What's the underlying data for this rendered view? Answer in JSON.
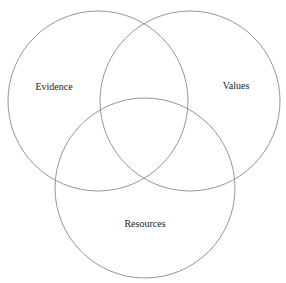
{
  "diagram": {
    "type": "venn",
    "stroke_color": "#8a8a8a",
    "circles": [
      {
        "id": "evidence",
        "label": "Evidence",
        "cx": 98,
        "cy": 101,
        "r": 90,
        "label_x": 54,
        "label_y": 86
      },
      {
        "id": "values",
        "label": "Values",
        "cx": 190,
        "cy": 101,
        "r": 90,
        "label_x": 236,
        "label_y": 85
      },
      {
        "id": "resources",
        "label": "Resources",
        "cx": 145,
        "cy": 188,
        "r": 90,
        "label_x": 145,
        "label_y": 223
      }
    ]
  }
}
